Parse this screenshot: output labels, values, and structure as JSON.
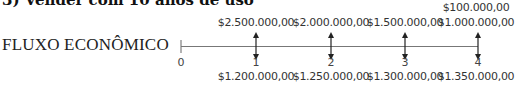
{
  "heading": "3) Vender com 10 anos de uso",
  "flow_label": "FLUXO ECONÔMICO",
  "timeline": {
    "start_label": "0",
    "line_color": "#666666",
    "arrow_color": "#222222",
    "periods": [
      {
        "label": "1",
        "inflows": [
          "$2.500.000,00"
        ],
        "outflow": "$1.200.000,00"
      },
      {
        "label": "2",
        "inflows": [
          "$2.000.000,00"
        ],
        "outflow": "$1.250.000,00"
      },
      {
        "label": "3",
        "inflows": [
          "$1.500.000,00"
        ],
        "outflow": "$1.300.000,00"
      },
      {
        "label": "4",
        "inflows": [
          "$100.000,00",
          "$1.000.000,00"
        ],
        "outflow": "$1.350.000,00"
      }
    ]
  }
}
